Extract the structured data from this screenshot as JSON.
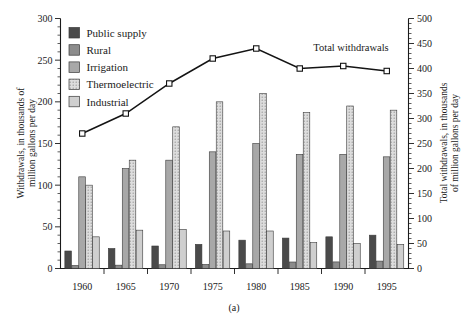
{
  "chart_data": {
    "type": "bar",
    "title": "",
    "caption": "(a)",
    "categories": [
      "1960",
      "1965",
      "1970",
      "1975",
      "1980",
      "1985",
      "1990",
      "1995"
    ],
    "xlabel": "",
    "ylabel": "Withdrawals, in thousands of\nmillion gallons per day",
    "ylabel_line1": "Withdrawals, in thousands of",
    "ylabel_line2": "million gallons per day",
    "ylim": [
      0,
      300
    ],
    "yticks": [
      0,
      50,
      100,
      150,
      200,
      250,
      300
    ],
    "y2label_line1": "Total withdrawals, in thousands",
    "y2label_line2": "of million gallons per day",
    "y2lim": [
      0,
      500
    ],
    "y2ticks": [
      0,
      50,
      100,
      150,
      200,
      250,
      300,
      350,
      400,
      450,
      500
    ],
    "grid": false,
    "legend_position": "top-left",
    "series": [
      {
        "name": "Public supply",
        "color": "#4a4a4a",
        "pattern": "solid",
        "values": [
          21,
          24,
          27,
          29,
          34,
          36.5,
          38,
          40
        ]
      },
      {
        "name": "Rural",
        "color": "#8c8c8c",
        "pattern": "solid",
        "values": [
          3.6,
          4,
          4.5,
          4.9,
          5.6,
          7.8,
          7.9,
          8.9
        ]
      },
      {
        "name": "Irrigation",
        "color": "#a8a8a8",
        "pattern": "solid",
        "values": [
          110,
          120,
          130,
          140,
          150,
          137,
          137,
          134
        ]
      },
      {
        "name": "Thermoelectric",
        "color": "#d6d6d6",
        "pattern": "dotted",
        "values": [
          100,
          130,
          170,
          200,
          210,
          187,
          195,
          190
        ]
      },
      {
        "name": "Industrial",
        "color": "#cfcfcf",
        "pattern": "solid",
        "values": [
          38,
          46,
          47,
          45,
          45,
          31,
          30,
          29
        ]
      }
    ],
    "line_series": {
      "name": "Total withdrawals",
      "annotation": "Total withdrawals",
      "axis": "right",
      "marker": "square-open",
      "values": [
        270,
        310,
        370,
        420,
        440,
        400,
        405,
        395
      ]
    }
  }
}
